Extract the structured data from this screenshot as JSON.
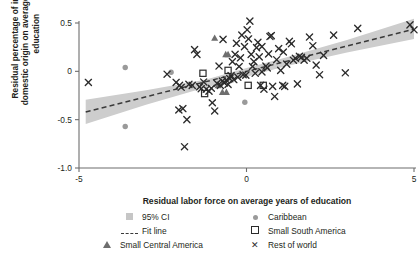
{
  "chart_data": {
    "type": "scatter",
    "title": "",
    "xlabel": "Residual labor force on average years of education",
    "ylabel": "Residual percentage of inputs of domestic origin on average years of education",
    "xlim": [
      -5,
      5
    ],
    "ylim": [
      -1.0,
      0.6
    ],
    "xticks": [
      -5,
      0,
      5
    ],
    "xticklabels": [
      "-5",
      "0",
      "5"
    ],
    "yticks": [
      0.5,
      0,
      -0.5,
      -1.0
    ],
    "yticklabels": [
      "0.5",
      "0",
      "-0.5",
      "-1.0"
    ],
    "grid": false,
    "legend_position": "below-axis",
    "fit_line": {
      "label": "Fit line",
      "style": "dashed",
      "color": "#3a3a3a",
      "slope": 0.0872,
      "intercept": 0.0,
      "x_start": -4.8,
      "x_end": 5.0,
      "y_start": -0.42,
      "y_end": 0.436
    },
    "confidence_band": {
      "label": "95% CI",
      "level": 0.95,
      "color": "#cdcdcd",
      "lower": [
        [
          -4.8,
          -0.545
        ],
        [
          -3.0,
          -0.345
        ],
        [
          -1.2,
          -0.165
        ],
        [
          0.0,
          -0.055
        ],
        [
          1.2,
          0.055
        ],
        [
          3.0,
          0.195
        ],
        [
          5.0,
          0.335
        ]
      ],
      "upper": [
        [
          -4.8,
          -0.295
        ],
        [
          -3.0,
          -0.195
        ],
        [
          -1.2,
          -0.085
        ],
        [
          0.0,
          0.035
        ],
        [
          1.2,
          0.145
        ],
        [
          3.0,
          0.325
        ],
        [
          5.0,
          0.545
        ]
      ]
    },
    "series": [
      {
        "name": "Caribbean",
        "marker": "filled-circle",
        "color": "#9a9a9a",
        "points": [
          [
            -3.62,
            0.04
          ],
          [
            -3.62,
            -0.57
          ],
          [
            -2.25,
            -0.01
          ],
          [
            -1.3,
            -0.02
          ],
          [
            -0.05,
            -0.32
          ]
        ]
      },
      {
        "name": "Small South America",
        "marker": "open-square",
        "color": "#2b2b2b",
        "points": [
          [
            -1.25,
            -0.23
          ],
          [
            -1.3,
            -0.02
          ],
          [
            -0.55,
            0.01
          ],
          [
            0.5,
            -0.145
          ],
          [
            0.05,
            -0.145
          ]
        ]
      },
      {
        "name": "Small Central America",
        "marker": "filled-triangle",
        "color": "#6e6e6e",
        "points": [
          [
            -0.95,
            0.345
          ],
          [
            -0.62,
            0.175
          ],
          [
            -0.55,
            0.175
          ],
          [
            -0.72,
            -0.215
          ],
          [
            -0.6,
            -0.215
          ],
          [
            -0.85,
            -0.145
          ]
        ]
      },
      {
        "name": "Rest of world",
        "marker": "x",
        "color": "#2b2b2b",
        "points": [
          [
            -4.72,
            -0.115
          ],
          [
            -2.37,
            -0.03
          ],
          [
            -2.02,
            -0.4
          ],
          [
            -1.9,
            -0.385
          ],
          [
            -1.85,
            -0.78
          ],
          [
            -1.78,
            -0.5
          ],
          [
            -1.72,
            -0.135
          ],
          [
            -1.62,
            -0.145
          ],
          [
            -1.55,
            0.225
          ],
          [
            -1.48,
            0.175
          ],
          [
            -1.4,
            -0.16
          ],
          [
            -1.35,
            -0.18
          ],
          [
            -1.28,
            -0.11
          ],
          [
            -1.2,
            -0.185
          ],
          [
            -1.12,
            -0.205
          ],
          [
            -1.05,
            -0.175
          ],
          [
            -1.02,
            -0.325
          ],
          [
            -0.95,
            -0.41
          ],
          [
            -0.88,
            -0.125
          ],
          [
            -0.82,
            0.055
          ],
          [
            -0.78,
            -0.145
          ],
          [
            -0.72,
            -0.1
          ],
          [
            -0.66,
            -0.12
          ],
          [
            -0.6,
            -0.09
          ],
          [
            -0.55,
            -0.135
          ],
          [
            -0.5,
            -0.075
          ],
          [
            -0.46,
            -0.045
          ],
          [
            -0.42,
            0.1
          ],
          [
            -0.38,
            -0.085
          ],
          [
            -0.34,
            0.175
          ],
          [
            -0.3,
            0.29
          ],
          [
            -0.26,
            -0.06
          ],
          [
            -0.22,
            0.05
          ],
          [
            -0.18,
            0.14
          ],
          [
            -0.14,
            0.375
          ],
          [
            -0.1,
            -0.035
          ],
          [
            -0.06,
            0.255
          ],
          [
            -0.02,
            -0.04
          ],
          [
            0.02,
            0.43
          ],
          [
            0.06,
            0.335
          ],
          [
            0.1,
            0.52
          ],
          [
            0.14,
            0.175
          ],
          [
            0.18,
            0.05
          ],
          [
            0.22,
            0.1
          ],
          [
            0.26,
            -0.02
          ],
          [
            0.3,
            0.245
          ],
          [
            0.34,
            0.3
          ],
          [
            0.38,
            0.15
          ],
          [
            0.42,
            -0.145
          ],
          [
            0.46,
            -0.005
          ],
          [
            0.52,
            -0.185
          ],
          [
            0.58,
            0.055
          ],
          [
            0.62,
            0.035
          ],
          [
            0.7,
            0.36
          ],
          [
            0.74,
            0.37
          ],
          [
            0.78,
            -0.155
          ],
          [
            0.84,
            -0.26
          ],
          [
            0.9,
            0.12
          ],
          [
            0.96,
            0.235
          ],
          [
            1.02,
            0.01
          ],
          [
            1.08,
            -0.145
          ],
          [
            1.14,
            -0.155
          ],
          [
            1.2,
            0.075
          ],
          [
            1.28,
            0.31
          ],
          [
            1.34,
            0.285
          ],
          [
            1.4,
            0.115
          ],
          [
            1.46,
            0.135
          ],
          [
            1.52,
            -0.13
          ],
          [
            1.58,
            0.155
          ],
          [
            1.64,
            0.145
          ],
          [
            1.72,
            0.115
          ],
          [
            1.8,
            0.135
          ],
          [
            1.88,
            0.355
          ],
          [
            1.98,
            0.265
          ],
          [
            2.08,
            0.065
          ],
          [
            2.18,
            -0.035
          ],
          [
            2.3,
            0.165
          ],
          [
            2.6,
            0.375
          ],
          [
            2.95,
            -0.015
          ],
          [
            3.32,
            0.445
          ],
          [
            4.88,
            0.48
          ],
          [
            5.0,
            0.43
          ],
          [
            -2.0,
            -0.145
          ],
          [
            -2.1,
            -0.115
          ],
          [
            -1.95,
            -0.165
          ],
          [
            0.66,
            0.18
          ],
          [
            1.1,
            0.2
          ],
          [
            0.46,
            0.255
          ],
          [
            -0.7,
            0.33
          ]
        ]
      }
    ]
  },
  "legend": {
    "items": [
      {
        "label": "95% CI",
        "marker": "ci-swatch"
      },
      {
        "label": "Caribbean",
        "marker": "filled-circle"
      },
      {
        "label": "Fit line",
        "marker": "dashed-line"
      },
      {
        "label": "Small South America",
        "marker": "open-square"
      },
      {
        "label": "Small Central America",
        "marker": "filled-triangle"
      },
      {
        "label": "Rest of world",
        "marker": "x"
      }
    ]
  },
  "colors": {
    "ci_band": "#cdcdcd",
    "fit_line": "#3a3a3a",
    "axis": "#6d6d6d",
    "text": "#231f20",
    "caribbean": "#9a9a9a",
    "central_america": "#6e6e6e",
    "marker_dark": "#2b2b2b"
  }
}
